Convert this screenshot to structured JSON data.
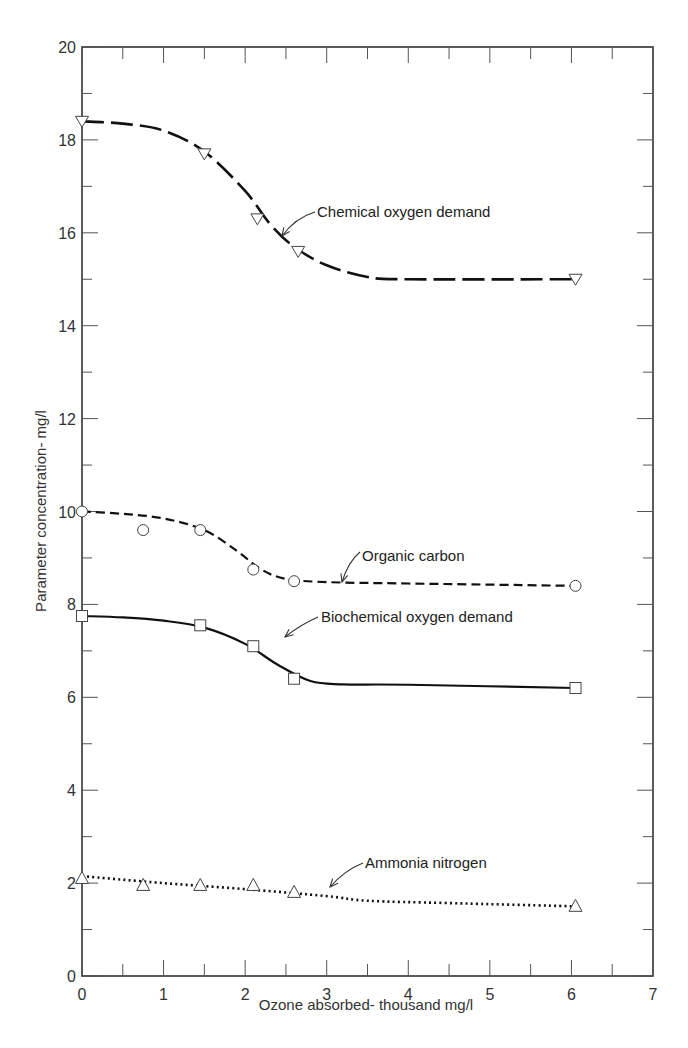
{
  "chart_data": {
    "type": "line",
    "title": "",
    "xlabel": "Ozone absorbed- thousand mg/l",
    "ylabel": "Parameter concentration- mg/l",
    "xlim": [
      0,
      7
    ],
    "ylim": [
      0,
      20
    ],
    "x_ticks": [
      0,
      1,
      2,
      3,
      4,
      5,
      6,
      7
    ],
    "y_ticks": [
      0,
      2,
      4,
      6,
      8,
      10,
      12,
      14,
      16,
      18,
      20
    ],
    "grid": false,
    "legend": "none (inline annotations with arrows)",
    "series": [
      {
        "name": "Chemical oxygen demand",
        "marker": "triangle-down",
        "line_style": "long-dash",
        "points": [
          [
            0,
            18.4
          ],
          [
            1.5,
            17.7
          ],
          [
            2.15,
            16.3
          ],
          [
            2.65,
            15.6
          ],
          [
            6.05,
            15.0
          ]
        ],
        "curve": [
          [
            0,
            18.4
          ],
          [
            0.5,
            18.35
          ],
          [
            1.0,
            18.2
          ],
          [
            1.5,
            17.75
          ],
          [
            2.0,
            16.9
          ],
          [
            2.3,
            16.2
          ],
          [
            2.6,
            15.7
          ],
          [
            3.0,
            15.3
          ],
          [
            3.5,
            15.05
          ],
          [
            4.0,
            15.0
          ],
          [
            6.05,
            15.0
          ]
        ]
      },
      {
        "name": "Organic carbon",
        "marker": "circle",
        "line_style": "short-dash",
        "points": [
          [
            0,
            10.0
          ],
          [
            0.75,
            9.6
          ],
          [
            1.45,
            9.6
          ],
          [
            2.1,
            8.75
          ],
          [
            2.6,
            8.5
          ],
          [
            6.05,
            8.4
          ]
        ],
        "curve": [
          [
            0,
            10.0
          ],
          [
            0.5,
            9.95
          ],
          [
            1.0,
            9.85
          ],
          [
            1.5,
            9.6
          ],
          [
            1.9,
            9.15
          ],
          [
            2.2,
            8.75
          ],
          [
            2.5,
            8.55
          ],
          [
            3.0,
            8.48
          ],
          [
            4.0,
            8.45
          ],
          [
            6.05,
            8.4
          ]
        ]
      },
      {
        "name": "Biochemical oxygen demand",
        "marker": "square",
        "line_style": "solid",
        "points": [
          [
            0,
            7.75
          ],
          [
            1.45,
            7.55
          ],
          [
            2.1,
            7.1
          ],
          [
            2.6,
            6.4
          ],
          [
            6.05,
            6.2
          ]
        ],
        "curve": [
          [
            0,
            7.75
          ],
          [
            0.5,
            7.72
          ],
          [
            1.0,
            7.65
          ],
          [
            1.5,
            7.5
          ],
          [
            2.0,
            7.15
          ],
          [
            2.4,
            6.7
          ],
          [
            2.8,
            6.35
          ],
          [
            3.2,
            6.28
          ],
          [
            4.0,
            6.27
          ],
          [
            6.05,
            6.2
          ]
        ]
      },
      {
        "name": "Ammonia nitrogen",
        "marker": "triangle-up",
        "line_style": "dotted",
        "points": [
          [
            0,
            2.1
          ],
          [
            0.75,
            1.95
          ],
          [
            1.45,
            1.95
          ],
          [
            2.1,
            1.95
          ],
          [
            2.6,
            1.8
          ],
          [
            6.05,
            1.5
          ]
        ],
        "curve": [
          [
            0,
            2.15
          ],
          [
            1.0,
            2.0
          ],
          [
            2.0,
            1.87
          ],
          [
            3.0,
            1.72
          ],
          [
            3.5,
            1.62
          ],
          [
            4.5,
            1.57
          ],
          [
            6.05,
            1.5
          ]
        ]
      }
    ],
    "annotations": [
      {
        "text": "Chemical oxygen demand",
        "x": 2.85,
        "y": 16.8
      },
      {
        "text": "Organic carbon",
        "x": 3.2,
        "y": 9.1
      },
      {
        "text": "Biochemical oxygen demand",
        "x": 2.9,
        "y": 7.7
      },
      {
        "text": "Ammonia nitrogen",
        "x": 3.5,
        "y": 2.3
      }
    ]
  },
  "axes": {
    "x_title": "Ozone absorbed- thousand mg/l",
    "y_title": "Parameter concentration- mg/l"
  },
  "labels": {
    "cod": "Chemical oxygen demand",
    "oc": "Organic carbon",
    "bod": "Biochemical oxygen demand",
    "nh3": "Ammonia nitrogen"
  }
}
